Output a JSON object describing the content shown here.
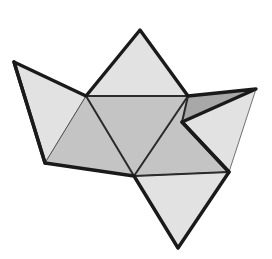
{
  "figure": {
    "canvas": {
      "width": 272,
      "height": 259,
      "background": "#ffffff"
    },
    "palette": {
      "background": "#ffffff",
      "face_light": "#e2e2e2",
      "face_mid": "#c4c4c4",
      "face_dark": "#a8a8a8",
      "edge_outline": "#1a1a1a",
      "edge_fold": "#2b2b2b",
      "face_stroke": "#1a1a1a"
    },
    "stroke_widths": {
      "outline": 3.4,
      "fold": 2.0,
      "face": 0.6
    },
    "vertices": {
      "left_tip": [
        14,
        62
      ],
      "left_bottom": [
        45,
        163
      ],
      "top_apex": [
        140,
        30
      ],
      "left_hub": [
        86,
        96
      ],
      "right_hub": [
        188,
        96
      ],
      "bottom_hub": [
        134,
        176
      ],
      "notch_inner": [
        182,
        122
      ],
      "right_tip": [
        256,
        89
      ],
      "right_lower": [
        229,
        172
      ],
      "bottom_apex": [
        178,
        248
      ],
      "right_flap_low": [
        196,
        139
      ]
    },
    "faces": [
      {
        "name": "top-apex-triangle",
        "shade": "face_light",
        "points": "140,30 86,96 188,96"
      },
      {
        "name": "left-wing-upper",
        "shade": "face_light",
        "points": "14,62 86,96 45,163"
      },
      {
        "name": "left-wing-lower",
        "shade": "face_mid",
        "points": "86,96 134,176 45,163"
      },
      {
        "name": "center-triangle",
        "shade": "face_mid",
        "points": "86,96 188,96 134,176"
      },
      {
        "name": "right-center-triangle",
        "shade": "face_mid",
        "points": "188,96 229,172 134,176"
      },
      {
        "name": "right-dark-wedge",
        "shade": "face_dark",
        "points": "188,96 256,89 182,122"
      },
      {
        "name": "right-notch-flap",
        "shade": "face_light",
        "points": "182,122 256,89 229,172"
      },
      {
        "name": "bottom-apex-triangle",
        "shade": "face_light",
        "points": "134,176 229,172 178,248"
      }
    ],
    "fold_edges": [
      {
        "name": "fold-left-hub-to-right-hub",
        "points": "86,96 188,96"
      },
      {
        "name": "fold-left-hub-to-bottom-hub",
        "points": "86,96 134,176"
      },
      {
        "name": "fold-right-hub-to-bottom-hub",
        "points": "188,96 134,176"
      },
      {
        "name": "fold-bottom-hub-to-right-lower",
        "points": "134,176 229,172"
      },
      {
        "name": "fold-right-hub-to-notch",
        "points": "188,96 182,122"
      }
    ],
    "outline_path": "M14,62 L86,96 L140,30 L188,96 L256,89 L182,122 L229,172 L178,248 L134,176 L45,163 Z",
    "secondary_outline": [
      {
        "name": "outline-left-tip-to-bottom",
        "points": "14,62 45,163"
      },
      {
        "name": "outline-notch-to-right-lower",
        "points": "182,122 229,172"
      }
    ]
  }
}
